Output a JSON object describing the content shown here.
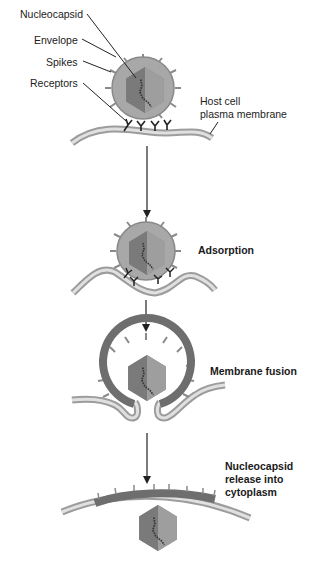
{
  "labels": {
    "nucleocapsid": "Nucleocapsid",
    "envelope": "Envelope",
    "spikes": "Spikes",
    "receptors": "Receptors",
    "host_line1": "Host cell",
    "host_line2": "plasma membrane"
  },
  "stages": {
    "adsorption": "Adsorption",
    "fusion": "Membrane fusion",
    "release_line1": "Nucleocapsid",
    "release_line2": "release into",
    "release_line3": "cytoplasm"
  },
  "colors": {
    "envelope": "#a8a8a8",
    "envelope_fused": "#6e6e6e",
    "capsid_light": "#9a9a9a",
    "capsid_dark": "#7c7c7c",
    "membrane": "#c8c8c8",
    "text": "#222222"
  }
}
